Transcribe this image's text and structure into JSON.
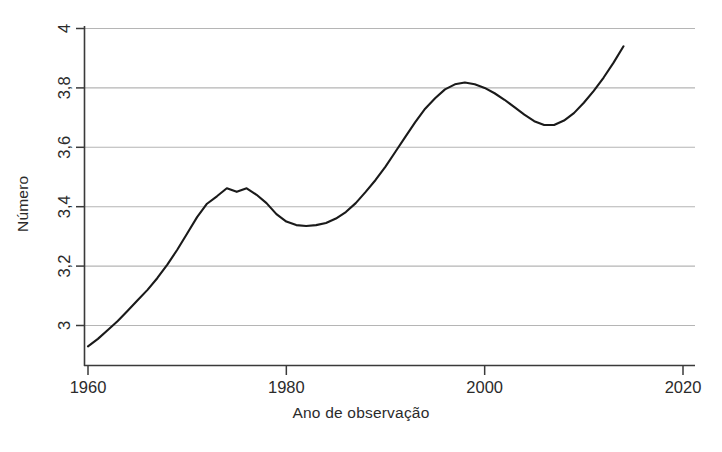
{
  "chart_data": {
    "type": "line",
    "title": "",
    "xlabel": "Ano de observação",
    "ylabel": "Número",
    "xlim": [
      1958,
      2021.5
    ],
    "ylim": [
      2.88,
      4.02
    ],
    "xticks": [
      1960,
      1980,
      2000,
      2020
    ],
    "xticklabels": [
      "1960",
      "1980",
      "2000",
      "2020"
    ],
    "yticks": [
      3,
      3.2,
      3.4,
      3.6,
      3.8,
      4
    ],
    "yticklabels": [
      "3",
      "3,2",
      "3,4",
      "3,6",
      "3,8",
      "4"
    ],
    "grid": "horizontal",
    "legend": "none",
    "line_color": "#1a1a1a",
    "grid_color": "#b5b5b5",
    "axis_color": "#3a3a3a",
    "series": [
      {
        "name": "Número",
        "x": [
          1960,
          1961,
          1962,
          1963,
          1964,
          1965,
          1966,
          1967,
          1968,
          1969,
          1970,
          1971,
          1972,
          1973,
          1974,
          1975,
          1976,
          1977,
          1978,
          1979,
          1980,
          1981,
          1982,
          1983,
          1984,
          1985,
          1986,
          1987,
          1988,
          1989,
          1990,
          1991,
          1992,
          1993,
          1994,
          1995,
          1996,
          1997,
          1998,
          1999,
          2000,
          2001,
          2002,
          2003,
          2004,
          2005,
          2006,
          2007,
          2008,
          2009,
          2010,
          2011,
          2012,
          2013,
          2014
        ],
        "values": [
          2.93,
          2.955,
          2.985,
          3.015,
          3.05,
          3.085,
          3.12,
          3.16,
          3.205,
          3.255,
          3.31,
          3.365,
          3.41,
          3.435,
          3.462,
          3.45,
          3.462,
          3.44,
          3.412,
          3.375,
          3.35,
          3.338,
          3.335,
          3.338,
          3.345,
          3.36,
          3.382,
          3.412,
          3.45,
          3.49,
          3.535,
          3.585,
          3.635,
          3.685,
          3.73,
          3.765,
          3.795,
          3.812,
          3.818,
          3.812,
          3.8,
          3.782,
          3.76,
          3.735,
          3.71,
          3.688,
          3.675,
          3.675,
          3.69,
          3.715,
          3.75,
          3.79,
          3.835,
          3.885,
          3.94
        ]
      }
    ]
  }
}
